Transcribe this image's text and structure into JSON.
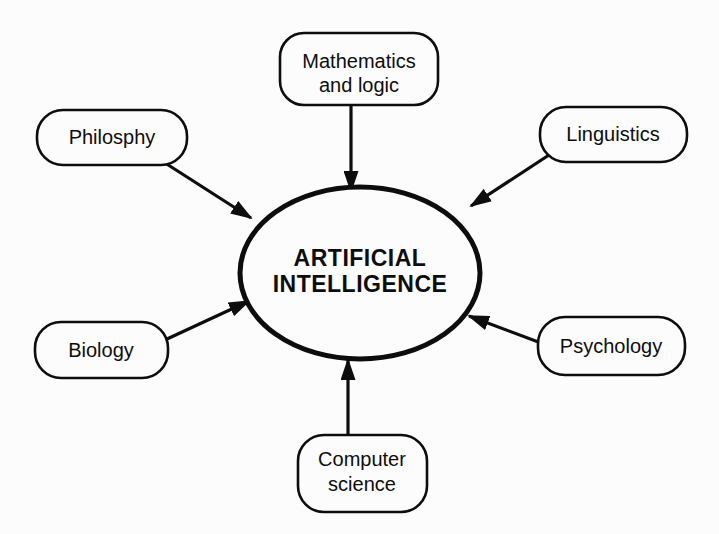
{
  "diagram": {
    "center": {
      "label_line1": "ARTIFICIAL",
      "label_line2": "INTELLIGENCE"
    },
    "nodes": [
      {
        "id": "mathematics-and-logic",
        "label_line1": "Mathematics",
        "label_line2": "and logic",
        "position": "top"
      },
      {
        "id": "philosophy",
        "label": "Philosphy",
        "position": "upper-left"
      },
      {
        "id": "linguistics",
        "label": "Linguistics",
        "position": "upper-right"
      },
      {
        "id": "biology",
        "label": "Biology",
        "position": "lower-left"
      },
      {
        "id": "psychology",
        "label": "Psychology",
        "position": "lower-right"
      },
      {
        "id": "computer-science",
        "label_line1": "Computer",
        "label_line2": "science",
        "position": "bottom"
      }
    ],
    "arrows": [
      {
        "from": "mathematics-and-logic",
        "to": "center"
      },
      {
        "from": "philosophy",
        "to": "center"
      },
      {
        "from": "linguistics",
        "to": "center"
      },
      {
        "from": "biology",
        "to": "center"
      },
      {
        "from": "psychology",
        "to": "center"
      },
      {
        "from": "computer-science",
        "to": "center"
      }
    ],
    "colors": {
      "ink": "#0d0d0d",
      "background": "#fcfcfc"
    }
  }
}
